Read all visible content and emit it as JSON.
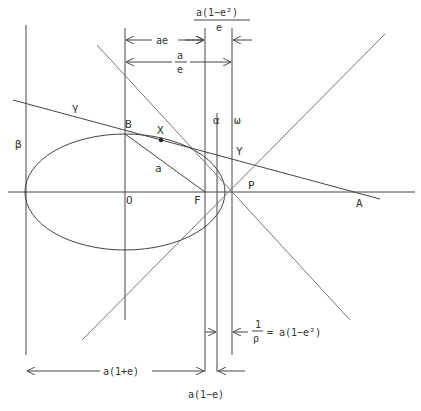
{
  "diagram": {
    "type": "geometry",
    "point_labels": {
      "B": "B",
      "X": "X",
      "O": "O",
      "F": "F",
      "P": "P",
      "Y": "Y",
      "A": "A",
      "a": "a"
    },
    "line_labels": {
      "beta": "β",
      "gamma": "γ",
      "alpha": "α",
      "omega": "ω"
    },
    "dimensions": {
      "top_fraction_num": "a(1−e²)",
      "top_fraction_den": "e",
      "ae": "ae",
      "a_over_e_num": "a",
      "a_over_e_den": "e",
      "rho_num": "1",
      "rho_den": "ρ",
      "rho_rhs": "= a(1−e²)",
      "a_one_plus_e": "a(1+e)",
      "a_one_minus_e": "a(1−e)"
    },
    "colors": {
      "line": "#444444",
      "light_line": "#777777",
      "text": "#333333",
      "background": "#ffffff"
    }
  }
}
